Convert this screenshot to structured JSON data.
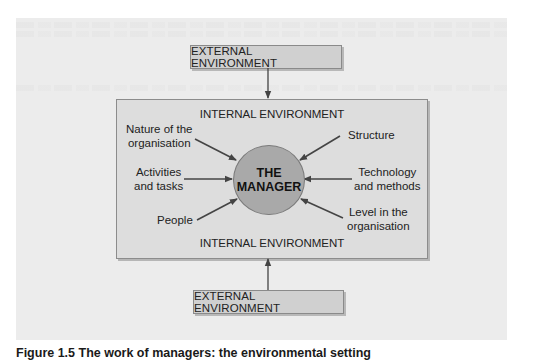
{
  "diagram": {
    "external_top": "EXTERNAL ENVIRONMENT",
    "external_bottom": "EXTERNAL ENVIRONMENT",
    "internal_top": "INTERNAL ENVIRONMENT",
    "internal_bottom": "INTERNAL ENVIRONMENT",
    "center": {
      "line1": "THE",
      "line2": "MANAGER"
    },
    "factors": {
      "nature": {
        "line1": "Nature of the",
        "line2": "organisation"
      },
      "activities": {
        "line1": "Activities",
        "line2": "and tasks"
      },
      "people": {
        "line1": "People"
      },
      "structure": {
        "line1": "Structure"
      },
      "technology": {
        "line1": "Technology",
        "line2": "and methods"
      },
      "level": {
        "line1": "Level in the",
        "line2": "organisation"
      }
    },
    "colors": {
      "panel": "#ececec",
      "internal_box": "#dddddd",
      "external_box": "#d0d0d0",
      "manager_circle": "#a9a9a9",
      "arrow": "#444444"
    }
  },
  "caption": "Figure 1.5 The work of managers: the environmental setting"
}
